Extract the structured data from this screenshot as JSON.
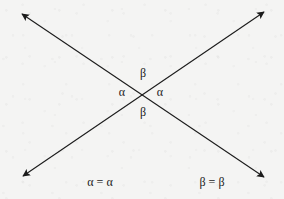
{
  "figure": {
    "background_color": "#f4f4f3",
    "ink_color": "#1b1b1b",
    "intersection": {
      "x": 142,
      "y": 92
    },
    "lines": [
      {
        "name": "line-nw-se",
        "from": {
          "x": 22,
          "y": 14
        },
        "to": {
          "x": 264,
          "y": 177
        },
        "arrow_start": true,
        "arrow_end": true
      },
      {
        "name": "line-sw-ne",
        "from": {
          "x": 23,
          "y": 176
        },
        "to": {
          "x": 264,
          "y": 12
        },
        "arrow_start": true,
        "arrow_end": true
      }
    ],
    "angle_labels": [
      {
        "id": "angle-top",
        "text": "β",
        "x": 143,
        "y": 73,
        "position": "top"
      },
      {
        "id": "angle-left",
        "text": "α",
        "x": 122,
        "y": 92,
        "position": "left"
      },
      {
        "id": "angle-right",
        "text": "α",
        "x": 160,
        "y": 92,
        "position": "right"
      },
      {
        "id": "angle-bottom",
        "text": "β",
        "x": 143,
        "y": 112,
        "position": "bottom"
      }
    ],
    "equations": [
      {
        "id": "equation-alpha",
        "text": "α = α",
        "x": 100,
        "y": 182
      },
      {
        "id": "equation-beta",
        "text": "β = β",
        "x": 212,
        "y": 182
      }
    ]
  }
}
